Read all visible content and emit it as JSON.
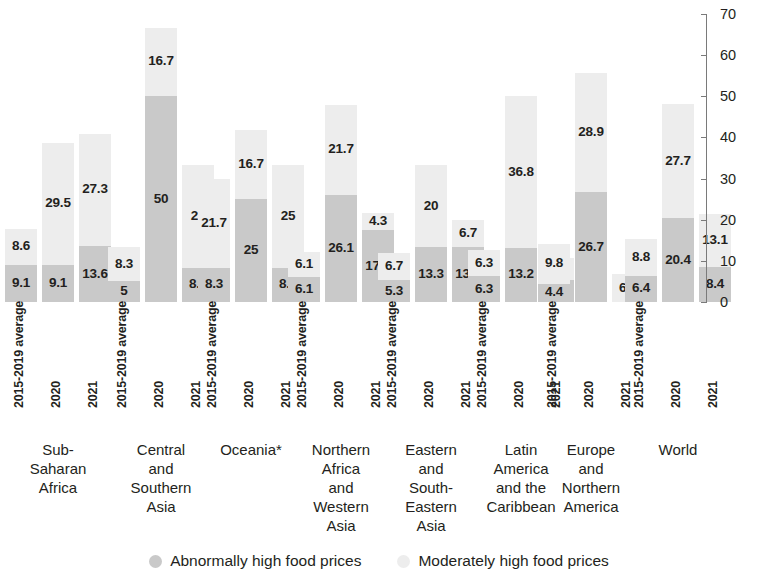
{
  "chart_data": {
    "type": "bar",
    "subtype": "stacked-bar-grouped",
    "title": "",
    "xlabel": "",
    "ylabel": "",
    "ylim": [
      0,
      70
    ],
    "ytick_labels": [
      "0",
      "10",
      "20",
      "30",
      "40",
      "50",
      "60",
      "70"
    ],
    "ytick_values": [
      0,
      10,
      20,
      30,
      40,
      50,
      60,
      70
    ],
    "grid": false,
    "legend_position": "bottom-center",
    "periods": [
      "2015-2019 average",
      "2020",
      "2021"
    ],
    "series": [
      {
        "name": "Abnormally high food prices",
        "color": "#c9c9c9"
      },
      {
        "name": "Moderately high food prices",
        "color": "#ededed"
      }
    ],
    "groups": [
      {
        "region": "Sub-Saharan Africa",
        "region_lines": [
          "Sub-",
          "Saharan",
          "Africa"
        ],
        "bars": [
          {
            "period": "2015-2019 average",
            "abnormally_high": 9.1,
            "moderately_high": 8.6,
            "label_abnormally": "9.1",
            "label_moderately": "8.6"
          },
          {
            "period": "2020",
            "abnormally_high": 9.1,
            "moderately_high": 29.5,
            "label_abnormally": "9.1",
            "label_moderately": "29.5"
          },
          {
            "period": "2021",
            "abnormally_high": 13.6,
            "moderately_high": 27.3,
            "label_abnormally": "13.6",
            "label_moderately": "27.3"
          }
        ]
      },
      {
        "region": "Central and Southern Asia",
        "region_lines": [
          "Central",
          "and",
          "Southern",
          "Asia"
        ],
        "bars": [
          {
            "period": "2015-2019 average",
            "abnormally_high": 5,
            "moderately_high": 8.3,
            "label_abnormally": "5",
            "label_moderately": "8.3"
          },
          {
            "period": "2020",
            "abnormally_high": 50,
            "moderately_high": 16.7,
            "label_abnormally": "50",
            "label_moderately": "16.7"
          },
          {
            "period": "2021",
            "abnormally_high": 8.3,
            "moderately_high": 25,
            "label_abnormally": "8.3",
            "label_moderately": "25"
          }
        ]
      },
      {
        "region": "Oceania*",
        "region_lines": [
          "Oceania*"
        ],
        "bars": [
          {
            "period": "2015-2019 average",
            "abnormally_high": 8.3,
            "moderately_high": 21.7,
            "label_abnormally": "8.3",
            "label_moderately": "21.7"
          },
          {
            "period": "2020",
            "abnormally_high": 25,
            "moderately_high": 16.7,
            "label_abnormally": "25",
            "label_moderately": "16.7"
          },
          {
            "period": "2021",
            "abnormally_high": 8.3,
            "moderately_high": 25,
            "label_abnormally": "8.3",
            "label_moderately": "25"
          }
        ]
      },
      {
        "region": "Northern Africa and Western Asia",
        "region_lines": [
          "Northern",
          "Africa",
          "and",
          "Western",
          "Asia"
        ],
        "bars": [
          {
            "period": "2015-2019 average",
            "abnormally_high": 6.1,
            "moderately_high": 6.1,
            "label_abnormally": "6.1",
            "label_moderately": "6.1"
          },
          {
            "period": "2020",
            "abnormally_high": 26.1,
            "moderately_high": 21.7,
            "label_abnormally": "26.1",
            "label_moderately": "21.7"
          },
          {
            "period": "2021",
            "abnormally_high": 17.4,
            "moderately_high": 4.3,
            "label_abnormally": "17.4",
            "label_moderately": "4.3"
          }
        ]
      },
      {
        "region": "Eastern and South-Eastern Asia",
        "region_lines": [
          "Eastern",
          "and",
          "South-",
          "Eastern",
          "Asia"
        ],
        "bars": [
          {
            "period": "2015-2019 average",
            "abnormally_high": 5.3,
            "moderately_high": 6.7,
            "label_abnormally": "5.3",
            "label_moderately": "6.7"
          },
          {
            "period": "2020",
            "abnormally_high": 13.3,
            "moderately_high": 20,
            "label_abnormally": "13.3",
            "label_moderately": "20"
          },
          {
            "period": "2021",
            "abnormally_high": 13.3,
            "moderately_high": 6.7,
            "label_abnormally": "13.3",
            "label_moderately": "6.7"
          }
        ]
      },
      {
        "region": "Latin America and the Caribbean",
        "region_lines": [
          "Latin",
          "America",
          "and the",
          "Caribbean"
        ],
        "bars": [
          {
            "period": "2015-2019 average",
            "abnormally_high": 6.3,
            "moderately_high": 6.3,
            "label_abnormally": "6.3",
            "label_moderately": "6.3"
          },
          {
            "period": "2020",
            "abnormally_high": 13.2,
            "moderately_high": 36.8,
            "label_abnormally": "13.2",
            "label_moderately": "36.8"
          },
          {
            "period": "2021",
            "abnormally_high": 5.3,
            "moderately_high": 5.3,
            "label_abnormally": "5.3",
            "label_moderately": "5.3"
          }
        ]
      },
      {
        "region": "Europe and Northern America",
        "region_lines": [
          "Europe",
          "and",
          "Northern",
          "America"
        ],
        "bars": [
          {
            "period": "2015-2019 average",
            "abnormally_high": 4.4,
            "moderately_high": 9.8,
            "label_abnormally": "4.4",
            "label_moderately": "9.8"
          },
          {
            "period": "2020",
            "abnormally_high": 26.7,
            "moderately_high": 28.9,
            "label_abnormally": "26.7",
            "label_moderately": "28.9"
          },
          {
            "period": "2021",
            "abnormally_high": 0,
            "moderately_high": 6.7,
            "label_abnormally": "",
            "label_moderately": "6.7"
          }
        ]
      },
      {
        "region": "World",
        "region_lines": [
          "World"
        ],
        "bars": [
          {
            "period": "2015-2019 average",
            "abnormally_high": 6.4,
            "moderately_high": 8.8,
            "label_abnormally": "6.4",
            "label_moderately": "8.8"
          },
          {
            "period": "2020",
            "abnormally_high": 20.4,
            "moderately_high": 27.7,
            "label_abnormally": "20.4",
            "label_moderately": "27.7"
          },
          {
            "period": "2021",
            "abnormally_high": 8.4,
            "moderately_high": 13.1,
            "label_abnormally": "8.4",
            "label_moderately": "13.1"
          }
        ]
      }
    ]
  },
  "colors": {
    "abnormally_high": "#c9c9c9",
    "moderately_high": "#ededed",
    "axis": "#7a7a7a",
    "text": "#231f20",
    "background": "#ffffff"
  },
  "legend": {
    "items": [
      {
        "label": "Abnormally high food prices",
        "swatch": "circle-swatch-dark"
      },
      {
        "label": "Moderately high food prices",
        "swatch": "circle-swatch-light"
      }
    ]
  }
}
